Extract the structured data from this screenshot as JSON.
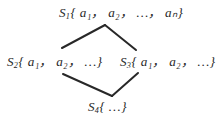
{
  "figure": {
    "type": "lattice-diagram",
    "background_color": "#ffffff",
    "ink_color": "#282828",
    "nodes": [
      {
        "id": "S1",
        "position": "top",
        "set_label": "S",
        "subscript": "1",
        "open_brace": "{",
        "elements": " a₁， a₂， …， aₙ",
        "close_brace": "}",
        "full_text": "S₁{ a₁, a₂, …, aₙ}"
      },
      {
        "id": "S2",
        "position": "left",
        "set_label": "S",
        "subscript": "2",
        "open_brace": "{",
        "elements": " a₁， a₂， …",
        "close_brace": "}",
        "full_text": "S₂{ a₁, a₂, …}"
      },
      {
        "id": "S3",
        "position": "right",
        "set_label": "S",
        "subscript": "3",
        "open_brace": "{",
        "elements": " a₁， a₂， …",
        "close_brace": "}",
        "full_text": "S₃{ a₁, a₂, …}"
      },
      {
        "id": "S4",
        "position": "bottom",
        "set_label": "S",
        "subscript": "4",
        "open_brace": "{",
        "elements": " …",
        "close_brace": "}",
        "full_text": "S₄{ …}"
      }
    ],
    "edges": [
      {
        "id": "edge-top-left",
        "from": "S1",
        "to": "S2",
        "x1": 105,
        "y1": 25,
        "x2": 62,
        "y2": 48
      },
      {
        "id": "edge-top-right",
        "from": "S1",
        "to": "S3",
        "x1": 105,
        "y1": 25,
        "x2": 136,
        "y2": 50
      },
      {
        "id": "edge-bottom-left",
        "from": "S2",
        "to": "S4",
        "x1": 63,
        "y1": 74,
        "x2": 112,
        "y2": 96
      },
      {
        "id": "edge-bottom-right",
        "from": "S3",
        "to": "S4",
        "x1": 138,
        "y1": 73,
        "x2": 112,
        "y2": 96
      }
    ]
  }
}
